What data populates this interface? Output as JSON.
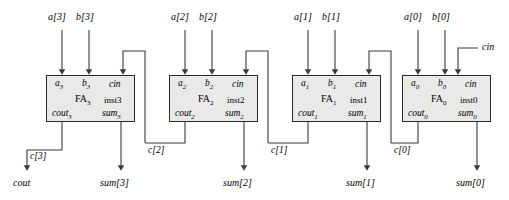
{
  "diagram": {
    "colors": {
      "block_fill": "#e9e9e7",
      "block_border": "#2b2b2b",
      "wire": "#3a3a3a",
      "text": "#000000"
    },
    "external_inputs": {
      "cin_label": "cin"
    },
    "external_outputs": {
      "cout_label": "cout"
    },
    "stages": [
      {
        "index": 3,
        "instance": "inst3",
        "name": "FA",
        "name_sub": "3",
        "port_a": "a",
        "port_a_sub": "3",
        "port_b": "b",
        "port_b_sub": "3",
        "port_cin": "cin",
        "port_cout": "cout",
        "port_cout_sub": "3",
        "port_sum": "sum",
        "port_sum_sub": "3",
        "input_a_label": "a[3]",
        "input_b_label": "b[3]",
        "carry_label": "c[3]",
        "sum_label": "sum[3]"
      },
      {
        "index": 2,
        "instance": "inst2",
        "name": "FA",
        "name_sub": "2",
        "port_a": "a",
        "port_a_sub": "2",
        "port_b": "b",
        "port_b_sub": "2",
        "port_cin": "cin",
        "port_cout": "cout",
        "port_cout_sub": "2",
        "port_sum": "sum",
        "port_sum_sub": "2",
        "input_a_label": "a[2]",
        "input_b_label": "b[2]",
        "carry_label": "c[2]",
        "sum_label": "sum[2]"
      },
      {
        "index": 1,
        "instance": "inst1",
        "name": "FA",
        "name_sub": "1",
        "port_a": "a",
        "port_a_sub": "1",
        "port_b": "b",
        "port_b_sub": "1",
        "port_cin": "cin",
        "port_cout": "cout",
        "port_cout_sub": "1",
        "port_sum": "sum",
        "port_sum_sub": "1",
        "input_a_label": "a[1]",
        "input_b_label": "b[1]",
        "carry_label": "c[1]",
        "sum_label": "sum[1]"
      },
      {
        "index": 0,
        "instance": "inst0",
        "name": "FA",
        "name_sub": "0",
        "port_a": "a",
        "port_a_sub": "0",
        "port_b": "b",
        "port_b_sub": "0",
        "port_cin": "cin",
        "port_cout": "cout",
        "port_cout_sub": "0",
        "port_sum": "sum",
        "port_sum_sub": "0",
        "input_a_label": "a[0]",
        "input_b_label": "b[0]",
        "carry_label": "c[0]",
        "sum_label": "sum[0]"
      }
    ]
  }
}
